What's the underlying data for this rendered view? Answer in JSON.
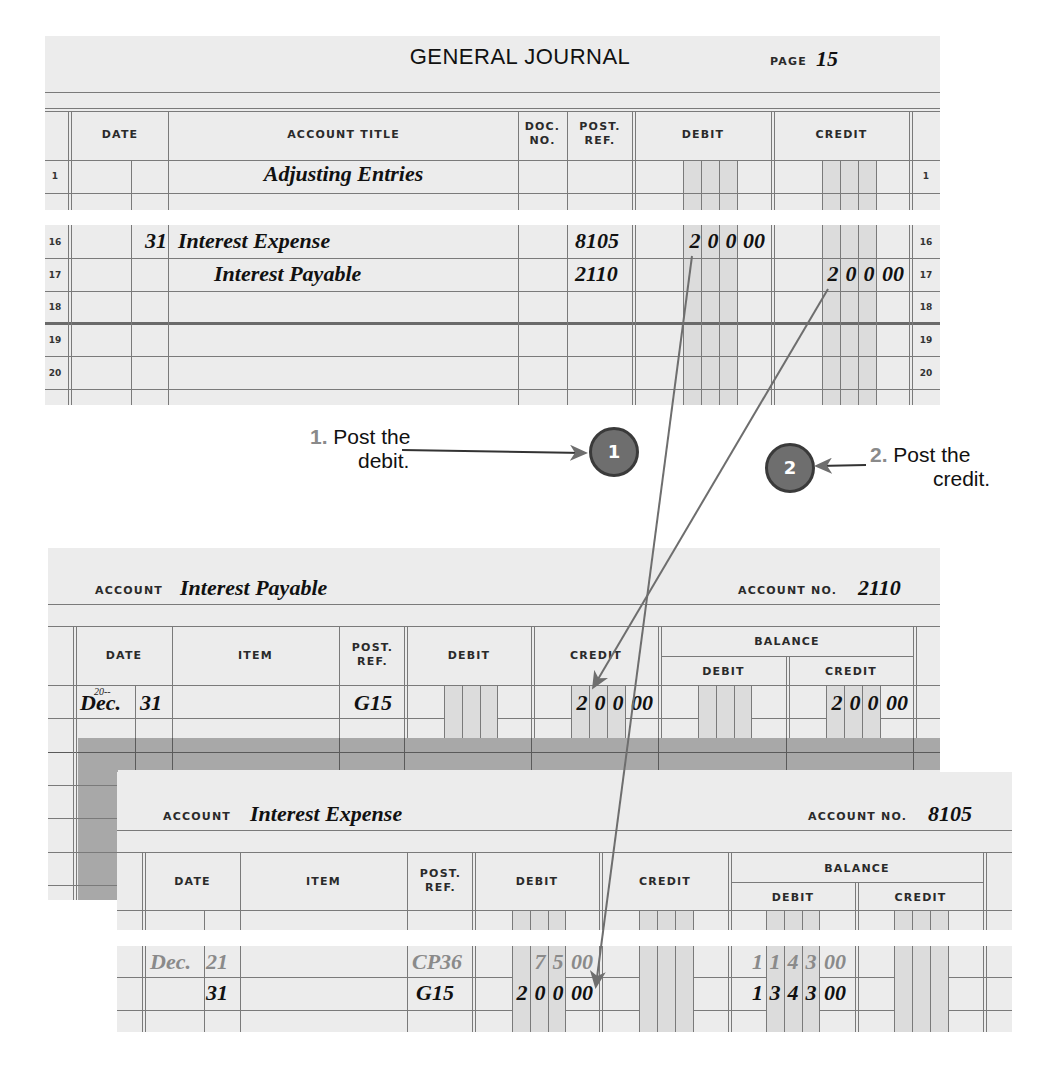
{
  "general_journal": {
    "title": "GENERAL JOURNAL",
    "page_label": "PAGE",
    "page_number": "15",
    "headers": {
      "date": "DATE",
      "account_title": "ACCOUNT TITLE",
      "doc_no_1": "DOC.",
      "doc_no_2": "NO.",
      "post_ref_1": "POST.",
      "post_ref_2": "REF.",
      "debit": "DEBIT",
      "credit": "CREDIT"
    },
    "rows": [
      {
        "line": "1",
        "day": "",
        "account": "Adjusting Entries",
        "post_ref": "",
        "debit": "",
        "credit": ""
      },
      {
        "line": "16",
        "day": "31",
        "account": "Interest Expense",
        "post_ref": "8105",
        "debit": "20000",
        "credit": ""
      },
      {
        "line": "17",
        "day": "",
        "account": "Interest Payable",
        "post_ref": "2110",
        "debit": "",
        "credit": "20000"
      },
      {
        "line": "18",
        "day": "",
        "account": "",
        "post_ref": "",
        "debit": "",
        "credit": ""
      },
      {
        "line": "19",
        "day": "",
        "account": "",
        "post_ref": "",
        "debit": "",
        "credit": ""
      },
      {
        "line": "20",
        "day": "",
        "account": "",
        "post_ref": "",
        "debit": "",
        "credit": ""
      }
    ]
  },
  "callouts": {
    "step1": {
      "number": "1.",
      "text_line1": "Post the",
      "text_line2": "debit.",
      "badge": "1"
    },
    "step2": {
      "number": "2.",
      "text_line1": "Post the",
      "text_line2": "credit.",
      "badge": "2"
    }
  },
  "ledger_interest_payable": {
    "account_label": "ACCOUNT",
    "account_name": "Interest Payable",
    "account_no_label": "ACCOUNT NO.",
    "account_no": "2110",
    "headers": {
      "date": "DATE",
      "item": "ITEM",
      "post_ref_1": "POST.",
      "post_ref_2": "REF.",
      "debit": "DEBIT",
      "credit": "CREDIT",
      "balance": "BALANCE",
      "balance_debit": "DEBIT",
      "balance_credit": "CREDIT"
    },
    "rows": [
      {
        "year": "20--",
        "month": "Dec.",
        "day": "31",
        "item": "",
        "post_ref": "G15",
        "debit": "",
        "credit": "20000",
        "balance_debit": "",
        "balance_credit": "20000"
      }
    ]
  },
  "ledger_interest_expense": {
    "account_label": "ACCOUNT",
    "account_name": "Interest Expense",
    "account_no_label": "ACCOUNT NO.",
    "account_no": "8105",
    "headers": {
      "date": "DATE",
      "item": "ITEM",
      "post_ref_1": "POST.",
      "post_ref_2": "REF.",
      "debit": "DEBIT",
      "credit": "CREDIT",
      "balance": "BALANCE",
      "balance_debit": "DEBIT",
      "balance_credit": "CREDIT"
    },
    "rows": [
      {
        "month": "Dec.",
        "day": "21",
        "item": "",
        "post_ref": "CP36",
        "debit": "7500",
        "credit": "",
        "balance_debit": "114300",
        "balance_credit": "",
        "muted": true
      },
      {
        "month": "",
        "day": "31",
        "item": "",
        "post_ref": "G15",
        "debit": "20000",
        "credit": "",
        "balance_debit": "134300",
        "balance_credit": "",
        "muted": false
      }
    ]
  },
  "colors": {
    "paper": "#ececec",
    "rule": "#7a7a7a",
    "shade_column": "#dcdcdc",
    "arrow": "#6e6e6e",
    "badge": "#6e6e6e",
    "step_number": "#8a8a8a"
  }
}
